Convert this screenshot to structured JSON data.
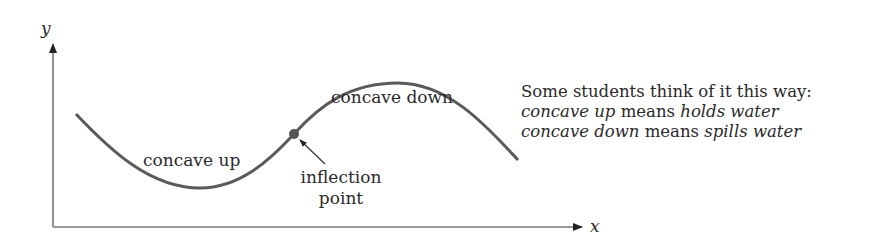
{
  "axes": {
    "y_label": "y",
    "x_label": "x"
  },
  "curve": {
    "color": "#555555",
    "point_color": "#555555"
  },
  "labels": {
    "concave_up": "concave up",
    "concave_down": "concave down",
    "inflection_line1": "inflection",
    "inflection_line2": "point"
  },
  "note": {
    "heading": "Some students think of it this way:",
    "line1_a": "concave up",
    "line1_b": " means ",
    "line1_c": "holds water",
    "line2_a": "concave down",
    "line2_b": " means ",
    "line2_c": "spills water"
  }
}
